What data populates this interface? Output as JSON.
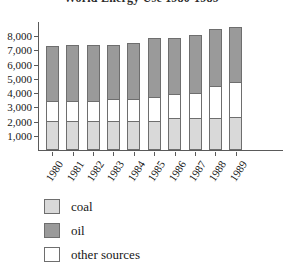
{
  "chart_data": {
    "type": "bar",
    "stacked": true,
    "title": "World Energy Use 1980-1989",
    "xlabel": "",
    "ylabel": "",
    "ylim": [
      0,
      9000
    ],
    "ytick_step": 1000,
    "grid": false,
    "legend_position": "below",
    "categories": [
      "1980",
      "1981",
      "1982",
      "1983",
      "1984",
      "1985",
      "1986",
      "1987",
      "1988",
      "1989"
    ],
    "ytick_labels": [
      "1,000",
      "2,000",
      "3,000",
      "4,000",
      "5,000",
      "6,000",
      "7,000",
      "8,000"
    ],
    "ytick_values": [
      1000,
      2000,
      3000,
      4000,
      5000,
      6000,
      7000,
      8000
    ],
    "series": [
      {
        "name": "coal",
        "color": "#d9d9d9",
        "values": [
          2050,
          2050,
          2050,
          2050,
          2050,
          2050,
          2250,
          2250,
          2250,
          2300
        ]
      },
      {
        "name": "other sources",
        "color": "#ffffff",
        "values": [
          1450,
          1450,
          1500,
          1600,
          1600,
          1750,
          1750,
          1850,
          2300,
          2550
        ]
      },
      {
        "name": "oil",
        "color": "#9a9a9a",
        "values": [
          3950,
          4000,
          3950,
          3850,
          4050,
          4250,
          4050,
          4100,
          4100,
          3950
        ]
      }
    ],
    "totals": [
      7450,
      7500,
      7500,
      7500,
      7700,
      8050,
      8050,
      8200,
      8650,
      8800
    ],
    "stack_order_bottom_to_top": [
      "coal",
      "other sources",
      "oil"
    ]
  },
  "legend": {
    "items": [
      {
        "label": "coal",
        "color": "#d9d9d9"
      },
      {
        "label": "oil",
        "color": "#9a9a9a"
      },
      {
        "label": "other sources",
        "color": "#ffffff"
      }
    ]
  }
}
